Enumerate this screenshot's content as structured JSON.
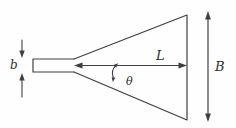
{
  "diagram": {
    "labels": {
      "waveguide_height": "b",
      "flare_length": "L",
      "flare_angle": "θ",
      "aperture_height": "B"
    },
    "colors": {
      "line": "#3f3f3f",
      "label_text": "#2d2d2d",
      "background": "#fefefe"
    }
  }
}
